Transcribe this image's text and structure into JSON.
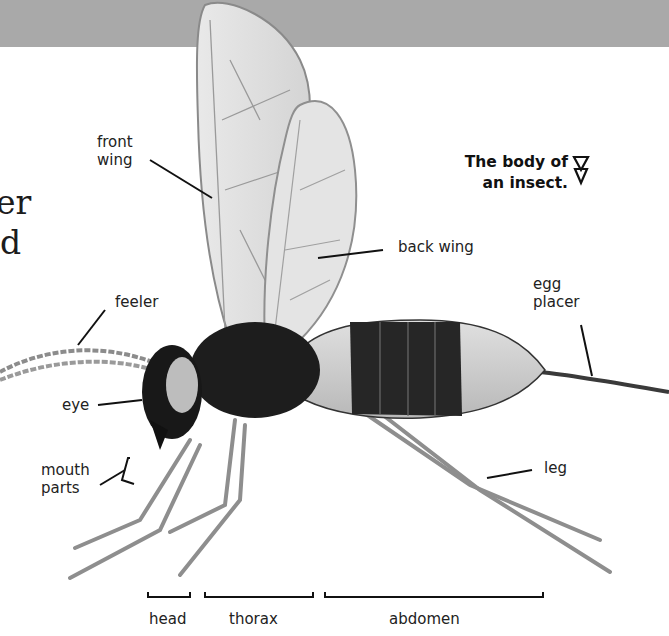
{
  "header_band": {
    "color": "#a9a9a9"
  },
  "cut_off_heading": {
    "line1": "er",
    "line2": "d"
  },
  "caption": {
    "line1": "The body of",
    "line2": "an insect.",
    "icon": "double-down-triangle-icon"
  },
  "labels": {
    "front_wing": {
      "line1": "front",
      "line2": "wing"
    },
    "back_wing": "back wing",
    "egg_placer": {
      "line1": "egg",
      "line2": "placer"
    },
    "feeler": "feeler",
    "eye": "eye",
    "mouth_parts": {
      "line1": "mouth",
      "line2": "parts"
    },
    "leg": "leg"
  },
  "body_sections": [
    {
      "label": "head"
    },
    {
      "label": "thorax"
    },
    {
      "label": "abdomen"
    }
  ]
}
